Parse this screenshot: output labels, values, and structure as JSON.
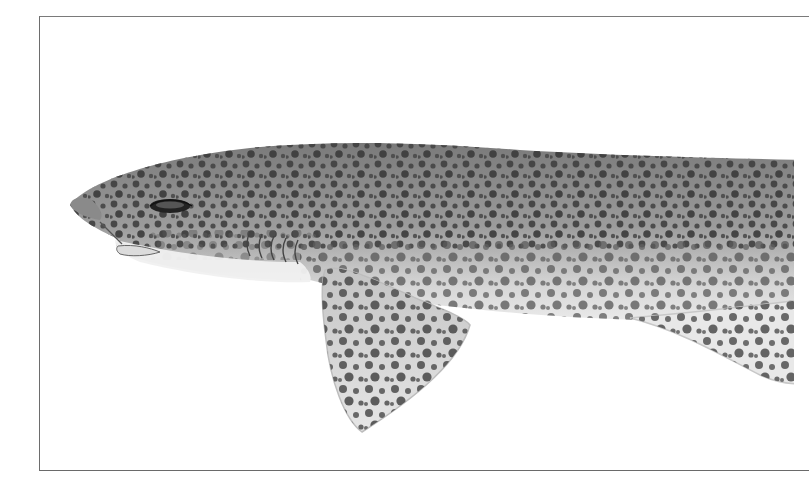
{
  "image": {
    "subject": "spotted shark illustration",
    "style": "grayscale scientific drawing",
    "background": "#ffffff",
    "frame_color": "#6d6d6d"
  },
  "colors": {
    "body_dark": "#6e6e6e",
    "body_mid": "#a8a8a8",
    "belly_light": "#eeeeee",
    "spot_dark": "#3a3a3a",
    "spot_mid": "#5c5c5c",
    "eye": "#111111"
  }
}
